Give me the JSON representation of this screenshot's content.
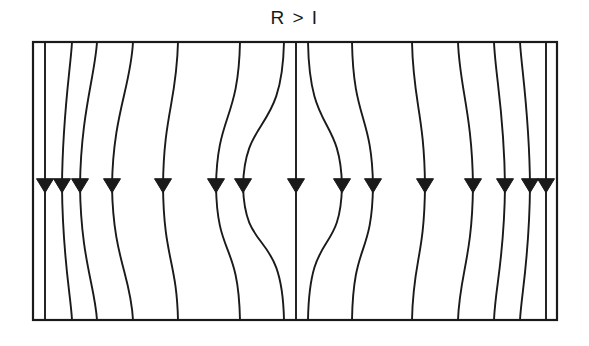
{
  "figure": {
    "title": "R > I",
    "title_position": "top-center",
    "background_color": "#ffffff",
    "line_color": "#1a1a1a",
    "frame": {
      "label": "domain-rectangle",
      "x": 33,
      "y": 42,
      "width": 524,
      "height": 278,
      "stroke_width": 2.2
    },
    "arrow": {
      "label": "flow-direction-arrowhead",
      "direction": "down",
      "row_y": 186,
      "half_width": 8.5,
      "height": 14,
      "count": 16
    },
    "singularities": [
      {
        "name": "top-convergence-point",
        "x": 296,
        "y": 42
      },
      {
        "name": "bottom-convergence-point",
        "x": 296,
        "y": 320
      }
    ]
  },
  "chart_data": {
    "type": "line",
    "title": "R > I",
    "xlabel": "",
    "ylabel": "",
    "xlim": [
      33,
      557
    ],
    "ylim": [
      42,
      320
    ],
    "grid": false,
    "legend": null,
    "axis_of_symmetry_x": 296,
    "mid_height_y": 186,
    "streamlines": [
      {
        "id": 1,
        "top_x": 33,
        "mid_x": 33,
        "bottom_x": 33,
        "arrow_x": null,
        "arrow": false,
        "note": "left wall"
      },
      {
        "id": 2,
        "top_x": 45,
        "mid_x": 45,
        "bottom_x": 45,
        "arrow_x": 45,
        "arrow": true
      },
      {
        "id": 3,
        "top_x": 72,
        "mid_x": 62,
        "bottom_x": 72,
        "arrow_x": 62,
        "arrow": true
      },
      {
        "id": 4,
        "top_x": 97,
        "mid_x": 80,
        "bottom_x": 97,
        "arrow_x": 80,
        "arrow": true
      },
      {
        "id": 5,
        "top_x": 133,
        "mid_x": 112,
        "bottom_x": 133,
        "arrow_x": 112,
        "arrow": true
      },
      {
        "id": 6,
        "top_x": 178,
        "mid_x": 163,
        "bottom_x": 178,
        "arrow_x": 163,
        "arrow": true
      },
      {
        "id": 7,
        "top_x": 240,
        "mid_x": 216,
        "bottom_x": 240,
        "arrow_x": 216,
        "arrow": true
      },
      {
        "id": 8,
        "top_x": 284,
        "mid_x": 243,
        "bottom_x": 284,
        "arrow_x": 243,
        "arrow": true
      },
      {
        "id": 9,
        "top_x": 296,
        "mid_x": 296,
        "bottom_x": 296,
        "arrow_x": 296,
        "arrow": true,
        "note": "central axis, straight"
      },
      {
        "id": 10,
        "top_x": 308,
        "mid_x": 342,
        "bottom_x": 308,
        "arrow_x": 342,
        "arrow": true
      },
      {
        "id": 11,
        "top_x": 352,
        "mid_x": 373,
        "bottom_x": 352,
        "arrow_x": 373,
        "arrow": true
      },
      {
        "id": 12,
        "top_x": 412,
        "mid_x": 425,
        "bottom_x": 412,
        "arrow_x": 425,
        "arrow": true
      },
      {
        "id": 13,
        "top_x": 458,
        "mid_x": 473,
        "bottom_x": 458,
        "arrow_x": 473,
        "arrow": true
      },
      {
        "id": 14,
        "top_x": 494,
        "mid_x": 505,
        "bottom_x": 494,
        "arrow_x": 505,
        "arrow": true
      },
      {
        "id": 15,
        "top_x": 520,
        "mid_x": 530,
        "bottom_x": 520,
        "arrow_x": 530,
        "arrow": true
      },
      {
        "id": 16,
        "top_x": 546,
        "mid_x": 546,
        "bottom_x": 546,
        "arrow_x": 546,
        "arrow": true
      },
      {
        "id": 17,
        "top_x": 557,
        "mid_x": 557,
        "bottom_x": 557,
        "arrow_x": null,
        "arrow": false,
        "note": "right wall"
      }
    ]
  }
}
